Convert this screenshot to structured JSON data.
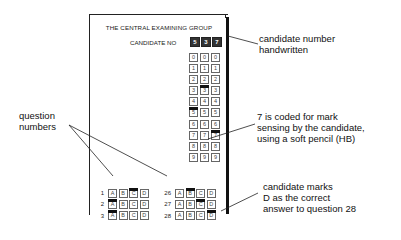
{
  "form": {
    "title": "THE CENTRAL EXAMINING GROUP",
    "candidate_label": "CANDIDATE NO",
    "candidate_number": [
      "5",
      "3",
      "7"
    ],
    "digit_grid": {
      "digits": [
        "0",
        "1",
        "2",
        "3",
        "4",
        "5",
        "6",
        "7",
        "8",
        "9"
      ],
      "marked": [
        "5",
        "3",
        "7"
      ]
    },
    "questions_left": [
      {
        "number": "1",
        "options": [
          "A",
          "B",
          "C",
          "D"
        ],
        "marked": "C"
      },
      {
        "number": "2",
        "options": [
          "A",
          "B",
          "C",
          "D"
        ],
        "marked": "A"
      },
      {
        "number": "3",
        "options": [
          "A",
          "B",
          "C",
          "D"
        ],
        "marked": "A"
      }
    ],
    "questions_right": [
      {
        "number": "26",
        "options": [
          "A",
          "B",
          "C",
          "D"
        ],
        "marked": "B"
      },
      {
        "number": "27",
        "options": [
          "A",
          "B",
          "C",
          "D"
        ],
        "marked": "C"
      },
      {
        "number": "28",
        "options": [
          "A",
          "B",
          "C",
          "D"
        ],
        "marked": "D"
      }
    ]
  },
  "annotations": {
    "candidate_number": [
      "candidate number",
      "handwritten"
    ],
    "mark_sensing": [
      "7 is coded for mark",
      "sensing by the candidate,",
      "using a soft pencil (HB)"
    ],
    "candidate_marks": [
      "candidate marks",
      "D as the correct",
      "answer to question 28"
    ],
    "question_numbers": [
      "question",
      "numbers"
    ]
  }
}
